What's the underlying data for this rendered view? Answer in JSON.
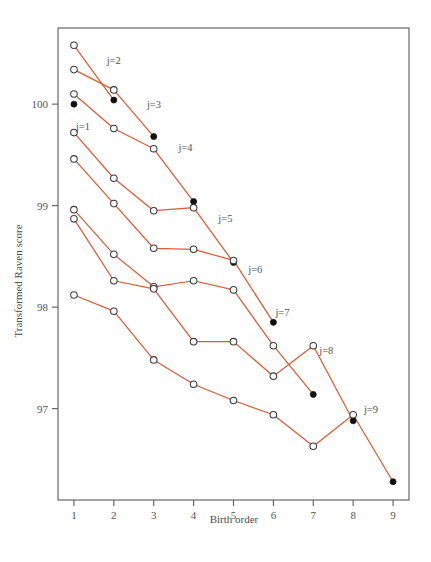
{
  "chart_data": {
    "type": "line",
    "title": "",
    "subtitle": "",
    "xlabel": "Birth order",
    "ylabel": "Transformed Raven score",
    "xlim": [
      0.6,
      9.4
    ],
    "ylim": [
      96.1,
      100.75
    ],
    "xticks": [
      1,
      2,
      3,
      4,
      5,
      6,
      7,
      8,
      9
    ],
    "xticklabels": [
      "1",
      "2",
      "3",
      "4",
      "5",
      "6",
      "7",
      "8",
      "9"
    ],
    "yticks": [
      97,
      98,
      99,
      100
    ],
    "yticklabels": [
      "97",
      "98",
      "99",
      "100"
    ],
    "grid": false,
    "legend_position": "inline-annotations",
    "accent_color": "#e05a33",
    "open_marker_note": "open circle = non-last-born child",
    "filled_marker_note": "filled circle = last-born child",
    "series": [
      {
        "name": "j=1",
        "label": "j=1",
        "label_x": 1.05,
        "label_y": 99.78,
        "x": [
          1
        ],
        "values": [
          100.0
        ],
        "filled": [
          true
        ]
      },
      {
        "name": "j=2",
        "label": "j=2",
        "label_x": 1.82,
        "label_y": 100.43,
        "x": [
          1,
          2
        ],
        "values": [
          100.58,
          100.04
        ],
        "filled": [
          false,
          true
        ]
      },
      {
        "name": "j=3",
        "label": "j=3",
        "label_x": 2.83,
        "label_y": 100.0,
        "x": [
          1,
          2,
          3
        ],
        "values": [
          100.34,
          100.14,
          99.68
        ],
        "filled": [
          false,
          false,
          true
        ]
      },
      {
        "name": "j=4",
        "label": "j=4",
        "label_x": 3.62,
        "label_y": 99.58,
        "x": [
          1,
          2,
          3,
          4
        ],
        "values": [
          100.1,
          99.76,
          99.56,
          99.04
        ],
        "filled": [
          false,
          false,
          false,
          true
        ]
      },
      {
        "name": "j=5",
        "label": "j=5",
        "label_x": 4.62,
        "label_y": 98.88,
        "x": [
          1,
          2,
          3,
          4,
          5
        ],
        "values": [
          99.72,
          99.27,
          98.95,
          98.98,
          98.44
        ],
        "filled": [
          false,
          false,
          false,
          false,
          true
        ]
      },
      {
        "name": "j=6",
        "label": "j=6",
        "label_x": 5.37,
        "label_y": 98.38,
        "x": [
          1,
          2,
          3,
          4,
          5,
          6
        ],
        "values": [
          99.46,
          99.02,
          98.58,
          98.57,
          98.46,
          97.85
        ],
        "filled": [
          false,
          false,
          false,
          false,
          false,
          true
        ]
      },
      {
        "name": "j=7",
        "label": "j=7",
        "label_x": 6.05,
        "label_y": 97.95,
        "x": [
          1,
          2,
          3,
          4,
          5,
          6,
          7
        ],
        "values": [
          98.96,
          98.52,
          98.2,
          98.26,
          98.17,
          97.62,
          97.14
        ],
        "filled": [
          false,
          false,
          false,
          false,
          false,
          false,
          true
        ]
      },
      {
        "name": "j=8",
        "label": "j=8",
        "label_x": 7.15,
        "label_y": 97.58,
        "x": [
          1,
          2,
          3,
          4,
          5,
          6,
          7,
          8
        ],
        "values": [
          98.87,
          98.26,
          98.18,
          97.66,
          97.66,
          97.32,
          97.62,
          96.88
        ],
        "filled": [
          false,
          false,
          false,
          false,
          false,
          false,
          false,
          true
        ]
      },
      {
        "name": "j=9",
        "label": "j=9",
        "label_x": 8.27,
        "label_y": 97.0,
        "x": [
          1,
          2,
          3,
          4,
          5,
          6,
          7,
          8,
          9
        ],
        "values": [
          98.12,
          97.96,
          97.48,
          97.24,
          97.08,
          96.94,
          96.63,
          96.94,
          96.28
        ],
        "filled": [
          false,
          false,
          false,
          false,
          false,
          false,
          false,
          false,
          true
        ]
      }
    ]
  }
}
